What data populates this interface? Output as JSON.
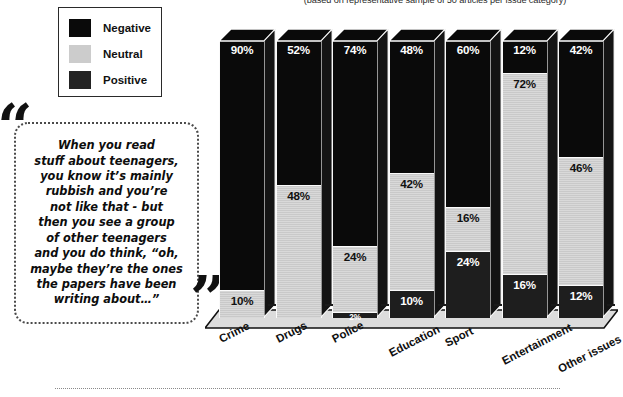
{
  "subtitle": "(based on representative sample of 50 articles per issue category)",
  "legend": {
    "items": [
      {
        "label": "Negative",
        "color": "#0a0a0a",
        "icon": "square-swatch-icon"
      },
      {
        "label": "Neutral",
        "color": "#cccccc",
        "icon": "square-swatch-icon"
      },
      {
        "label": "Positive",
        "color": "#232323",
        "icon": "square-swatch-icon"
      }
    ]
  },
  "quote": {
    "open_mark": "“",
    "close_mark": "”",
    "text": "When you read\nstuff about teenagers,\nyou know it’s mainly\nrubbish and you’re\nnot like that - but\nthen you see a group\nof other teenagers\nand you do think, “oh,\nmaybe they’re the ones\nthe papers have been\nwriting about…”"
  },
  "chart_data": {
    "type": "bar",
    "subtype": "stacked-3d-column",
    "title": "",
    "subtitle": "(based on representative sample of 50 articles per issue category)",
    "xlabel": "",
    "ylabel": "",
    "ylim": [
      0,
      100
    ],
    "grid": false,
    "legend_position": "top-left",
    "categories": [
      "Crime",
      "Drugs",
      "Police",
      "Education",
      "Sport",
      "Entertainment",
      "Other issues"
    ],
    "series": [
      {
        "name": "Negative",
        "color": "#0a0a0a",
        "values": [
          90,
          52,
          74,
          48,
          60,
          12,
          42
        ]
      },
      {
        "name": "Neutral",
        "color": "#cccccc",
        "values": [
          0,
          48,
          24,
          42,
          16,
          72,
          46
        ]
      },
      {
        "name": "Positive",
        "color": "#1e1e1e",
        "values": [
          10,
          0,
          2,
          10,
          24,
          16,
          12
        ]
      }
    ],
    "stack_order_top_to_bottom": [
      "Negative",
      "Neutral",
      "Positive"
    ],
    "bars": [
      {
        "category": "Crime",
        "segments": [
          {
            "series": "Negative",
            "value": 90,
            "label": "90%",
            "label_color": "light"
          },
          {
            "series": "Neutral",
            "value": 10,
            "label": "10%",
            "label_color": "dark"
          }
        ]
      },
      {
        "category": "Drugs",
        "segments": [
          {
            "series": "Negative",
            "value": 52,
            "label": "52%",
            "label_color": "light"
          },
          {
            "series": "Neutral",
            "value": 48,
            "label": "48%",
            "label_color": "dark"
          }
        ]
      },
      {
        "category": "Police",
        "segments": [
          {
            "series": "Negative",
            "value": 74,
            "label": "74%",
            "label_color": "light"
          },
          {
            "series": "Neutral",
            "value": 24,
            "label": "24%",
            "label_color": "dark"
          },
          {
            "series": "Positive",
            "value": 2,
            "label": "2%",
            "label_color": "light"
          }
        ]
      },
      {
        "category": "Education",
        "segments": [
          {
            "series": "Negative",
            "value": 48,
            "label": "48%",
            "label_color": "light"
          },
          {
            "series": "Neutral",
            "value": 42,
            "label": "42%",
            "label_color": "dark"
          },
          {
            "series": "Positive",
            "value": 10,
            "label": "10%",
            "label_color": "light"
          }
        ]
      },
      {
        "category": "Sport",
        "segments": [
          {
            "series": "Negative",
            "value": 60,
            "label": "60%",
            "label_color": "light"
          },
          {
            "series": "Neutral",
            "value": 16,
            "label": "16%",
            "label_color": "dark"
          },
          {
            "series": "Positive",
            "value": 24,
            "label": "24%",
            "label_color": "light"
          }
        ]
      },
      {
        "category": "Entertainment",
        "segments": [
          {
            "series": "Negative",
            "value": 12,
            "label": "12%",
            "label_color": "light"
          },
          {
            "series": "Neutral",
            "value": 72,
            "label": "72%",
            "label_color": "dark"
          },
          {
            "series": "Positive",
            "value": 16,
            "label": "16%",
            "label_color": "light"
          }
        ]
      },
      {
        "category": "Other issues",
        "segments": [
          {
            "series": "Negative",
            "value": 42,
            "label": "42%",
            "label_color": "light"
          },
          {
            "series": "Neutral",
            "value": 46,
            "label": "46%",
            "label_color": "dark"
          },
          {
            "series": "Positive",
            "value": 12,
            "label": "12%",
            "label_color": "light"
          }
        ]
      }
    ]
  }
}
